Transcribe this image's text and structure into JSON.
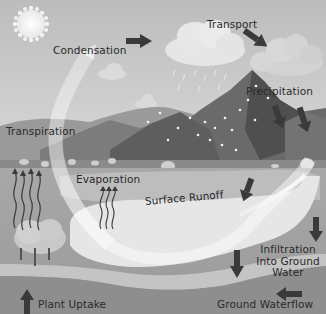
{
  "diagram": {
    "type": "water-cycle",
    "palette": {
      "sky": "#c9c9c9",
      "sky_top": "#bdbdbd",
      "sun": "#f4f4f4",
      "cloud": "#e2e2e2",
      "cloud_dark": "#cfcfcf",
      "mountain_dark": "#5a5a5a",
      "mountain_mid": "#7a7a7a",
      "mountain_light": "#9a9a9a",
      "hills": "#8c8c8c",
      "meadow": "#b0b0b0",
      "lake": "#e8e8e8",
      "river": "#dcdcdc",
      "soil": "#8a8a8a",
      "soil_band": "#bdbdbd",
      "ground_deep": "#7c7c7c",
      "arrow": "#3a3a3a",
      "text": "#2a2a2a"
    },
    "labels": {
      "condensation": "Condensation",
      "transport": "Transport",
      "precipitation": "Precipitation",
      "transpiration": "Transpiration",
      "evaporation": "Evaporation",
      "surface_runoff": "Surface Runoff",
      "infiltration_line1": "Infiltration",
      "infiltration_line2": "Into Ground",
      "infiltration_line3": "Water",
      "plant_uptake": "Plant Uptake",
      "ground_waterflow": "Ground Waterflow"
    }
  }
}
